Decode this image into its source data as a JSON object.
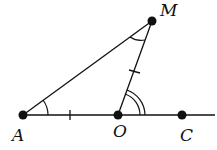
{
  "diagram": {
    "type": "geometry",
    "points": {
      "A": {
        "label": "A",
        "x": 23,
        "y": 115
      },
      "O": {
        "label": "O",
        "x": 118,
        "y": 115
      },
      "C": {
        "label": "C",
        "x": 182,
        "y": 115
      },
      "M": {
        "label": "M",
        "x": 152,
        "y": 21
      }
    },
    "segments": [
      "AM",
      "OM",
      "AC (ray through O and C)"
    ],
    "markings": {
      "equal_segments": [
        "AO",
        "OM"
      ],
      "angle_single_arc": [
        "MAO",
        "AMO"
      ],
      "angle_double_arc": [
        "MOC"
      ]
    },
    "colors": {
      "stroke": "#111111",
      "background": "#ffffff"
    }
  }
}
